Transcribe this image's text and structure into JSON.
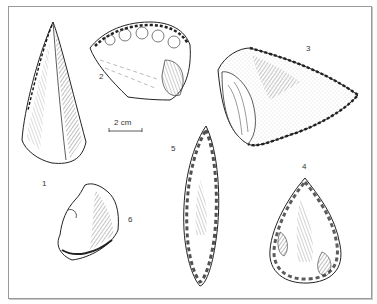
{
  "figure": {
    "scale_bar": {
      "label": "2 cm"
    },
    "artifacts": [
      {
        "number": "1",
        "shape": "elongated pointed blade"
      },
      {
        "number": "2",
        "shape": "semicircular retouched scraper"
      },
      {
        "number": "3",
        "shape": "triangular retouched point"
      },
      {
        "number": "4",
        "shape": "teardrop handaxe"
      },
      {
        "number": "5",
        "shape": "leaf-shaped bifacial point"
      },
      {
        "number": "6",
        "shape": "small flake"
      }
    ],
    "labels": {
      "a1": "1",
      "a2": "2",
      "a3": "3",
      "a4": "4",
      "a5": "5",
      "a6": "6"
    },
    "colors": {
      "ink": "#2a2a2a",
      "frame": "#9a9a9a",
      "background": "#ffffff"
    }
  }
}
